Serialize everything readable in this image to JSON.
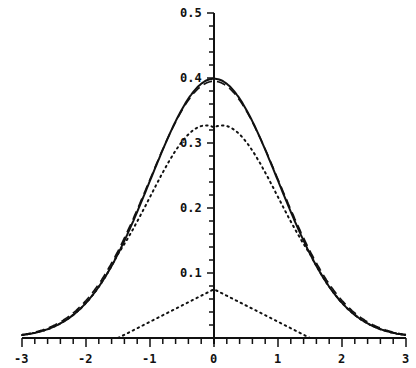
{
  "chart_data": {
    "type": "line",
    "title": "",
    "xlabel": "",
    "ylabel": "",
    "xlim": [
      -3,
      3
    ],
    "ylim": [
      0,
      0.5
    ],
    "x_ticks": [
      "-3",
      "-2",
      "-1",
      "0",
      "1",
      "2",
      "3"
    ],
    "y_ticks": [
      "0.1",
      "0.2",
      "0.3",
      "0.4",
      "0.5"
    ],
    "grid": false,
    "legend": null,
    "series": [
      {
        "name": "solid",
        "style": "solid",
        "description": "standard normal density",
        "peak": 0.399
      },
      {
        "name": "dashed",
        "style": "dashed",
        "description": "approximating density",
        "peak": 0.395
      },
      {
        "name": "dotted-bell",
        "style": "dotted",
        "description": "bell component",
        "peak": 0.325
      },
      {
        "name": "dotted-triangle",
        "style": "dotted",
        "description": "triangular component on [-1.5,1.5]",
        "peak": 0.075
      }
    ]
  }
}
